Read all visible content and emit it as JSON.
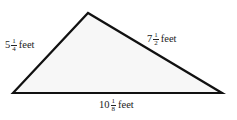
{
  "figure": {
    "shape": "triangle",
    "fill_color": "#f7f7f7",
    "stroke_color": "#111111",
    "sides": {
      "left": {
        "whole": "5",
        "numerator": "1",
        "denominator": "4",
        "unit": "feet"
      },
      "right": {
        "whole": "7",
        "numerator": "1",
        "denominator": "2",
        "unit": "feet"
      },
      "base": {
        "whole": "10",
        "numerator": "1",
        "denominator": "8",
        "unit": "feet"
      }
    }
  }
}
